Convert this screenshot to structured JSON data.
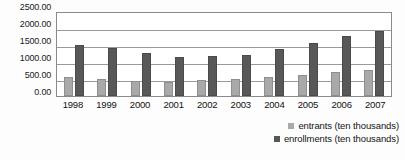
{
  "chart_data": {
    "type": "bar",
    "title": "",
    "xlabel": "",
    "ylabel": "",
    "ylim": [
      0,
      2500
    ],
    "ytick_labels": [
      "2500.00",
      "2000.00",
      "1500.00",
      "1000.00",
      "500.00",
      "0.00"
    ],
    "ytick_values": [
      2500,
      2000,
      1500,
      1000,
      500,
      0
    ],
    "grid": true,
    "legend_position": "bottom-right",
    "categories": [
      "1998",
      "1999",
      "2000",
      "2001",
      "2002",
      "2003",
      "2004",
      "2005",
      "2006",
      "2007"
    ],
    "series": [
      {
        "name": "entrants (ten thousands)",
        "color": "#a9a9a9",
        "values": [
          570,
          490,
          430,
          420,
          470,
          500,
          550,
          630,
          720,
          760
        ]
      },
      {
        "name": "enrollments (ten thousands)",
        "color": "#585858",
        "values": [
          1490,
          1420,
          1260,
          1150,
          1180,
          1210,
          1390,
          1560,
          1770,
          1910
        ]
      }
    ]
  },
  "legend": {
    "items": [
      {
        "label": "entrants (ten thousands)",
        "swatch": "entrants"
      },
      {
        "label": "enrollments (ten thousands)",
        "swatch": "enrollments"
      }
    ]
  }
}
